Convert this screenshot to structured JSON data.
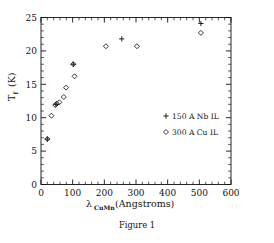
{
  "figure": {
    "caption": "Figure 1"
  },
  "chart_data": {
    "type": "scatter",
    "title": "",
    "xlabel": "λ",
    "xlabel_subscript": "CuMn",
    "xlabel_units": "(Angstroms)",
    "ylabel": "T",
    "ylabel_subscript": "f",
    "ylabel_units": "(K)",
    "xlim": [
      0,
      600
    ],
    "ylim": [
      0,
      25
    ],
    "xticks": [
      0,
      100,
      200,
      300,
      400,
      500,
      600
    ],
    "xticklabels": [
      "0",
      "100",
      "200",
      "300",
      "400",
      "500",
      "600"
    ],
    "yticks": [
      0,
      5,
      10,
      15,
      20,
      25
    ],
    "yticklabels": [
      "0",
      "5",
      "10",
      "15",
      "20",
      "25"
    ],
    "x_minor_interval": 20,
    "y_minor_interval": 1,
    "grid": false,
    "frame": true,
    "tick_direction": "in",
    "legend_position": "center-right",
    "series": [
      {
        "name": "150 A Nb IL",
        "marker": "plus",
        "points": [
          {
            "x": 20,
            "y": 6.8
          },
          {
            "x": 47,
            "y": 12.0
          },
          {
            "x": 102,
            "y": 18.0
          },
          {
            "x": 255,
            "y": 21.8
          },
          {
            "x": 505,
            "y": 24.1
          }
        ]
      },
      {
        "name": "300 A Cu IL",
        "marker": "diamond",
        "points": [
          {
            "x": 20,
            "y": 6.8
          },
          {
            "x": 33,
            "y": 10.3
          },
          {
            "x": 45,
            "y": 11.9
          },
          {
            "x": 50,
            "y": 12.1
          },
          {
            "x": 58,
            "y": 12.3
          },
          {
            "x": 72,
            "y": 13.1
          },
          {
            "x": 79,
            "y": 14.5
          },
          {
            "x": 102,
            "y": 18.0
          },
          {
            "x": 106,
            "y": 16.2
          },
          {
            "x": 205,
            "y": 20.7
          },
          {
            "x": 303,
            "y": 20.7
          },
          {
            "x": 505,
            "y": 22.7
          }
        ]
      }
    ],
    "legend": [
      {
        "marker": "plus",
        "label": "150 A Nb IL"
      },
      {
        "marker": "diamond",
        "label": "300 A Cu IL"
      }
    ]
  }
}
